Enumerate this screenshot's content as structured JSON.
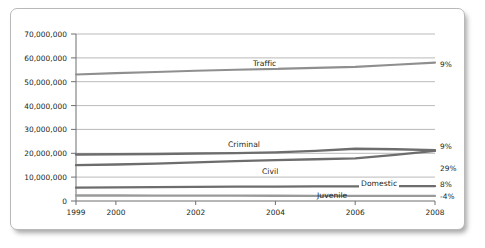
{
  "chart_data": {
    "type": "line",
    "title": "",
    "subtitle": "",
    "xlabel": "",
    "ylabel": "",
    "x": [
      1999,
      2000,
      2001,
      2002,
      2003,
      2004,
      2005,
      2006,
      2007,
      2008
    ],
    "xlim": [
      1999,
      2008
    ],
    "ylim": [
      0,
      70000000
    ],
    "grid": true,
    "grid_axis": "y",
    "legend": "inline-labels",
    "x_tick_labels": [
      "1999",
      "2000",
      "2002",
      "2004",
      "2006",
      "2008"
    ],
    "x_tick_values": [
      1999,
      2000,
      2002,
      2004,
      2006,
      2008
    ],
    "y_tick_labels": [
      "70,000,000",
      "60,000,000",
      "50,000,000",
      "40,000,000",
      "30,000,000",
      "20,000,000",
      "10,000,000",
      "0"
    ],
    "y_tick_values": [
      70000000,
      60000000,
      50000000,
      40000000,
      30000000,
      20000000,
      10000000,
      0
    ],
    "series": [
      {
        "name": "Traffic",
        "label": "Traffic",
        "change_label": "9%",
        "color": "#8f8f8f",
        "values": [
          53000000,
          53600000,
          54100000,
          54600000,
          55000000,
          55400000,
          55800000,
          56200000,
          57100000,
          58000000
        ]
      },
      {
        "name": "Criminal",
        "label": "Criminal",
        "change_label": "9%",
        "color": "#6d6d6d",
        "values": [
          19500000,
          19600000,
          19700000,
          19900000,
          20100000,
          20400000,
          21000000,
          21900000,
          21700000,
          21300000
        ]
      },
      {
        "name": "Civil",
        "label": "Civil",
        "change_label": "29%",
        "color": "#6d6d6d",
        "values": [
          15000000,
          15300000,
          15700000,
          16200000,
          16700000,
          17100000,
          17500000,
          17900000,
          19300000,
          21000000
        ]
      },
      {
        "name": "Domestic",
        "label": "Domestic",
        "change_label": "8%",
        "color": "#6d6d6d",
        "values": [
          5600000,
          5700000,
          5800000,
          5900000,
          6000000,
          6050000,
          6100000,
          6150000,
          6200000,
          6200000
        ]
      },
      {
        "name": "Juvenile",
        "label": "Juvenile",
        "change_label": "-4%",
        "color": "#9a9a9a",
        "values": [
          2300000,
          2300000,
          2280000,
          2250000,
          2220000,
          2200000,
          2180000,
          2160000,
          2140000,
          2120000
        ]
      }
    ]
  },
  "axes": {
    "y_ticks": [
      {
        "label": "70,000,000",
        "value": 70000000
      },
      {
        "label": "60,000,000",
        "value": 60000000
      },
      {
        "label": "50,000,000",
        "value": 50000000
      },
      {
        "label": "40,000,000",
        "value": 40000000
      },
      {
        "label": "30,000,000",
        "value": 30000000
      },
      {
        "label": "20,000,000",
        "value": 20000000
      },
      {
        "label": "10,000,000",
        "value": 10000000
      },
      {
        "label": "0",
        "value": 0
      }
    ],
    "x_ticks": [
      {
        "label": "1999",
        "value": 1999
      },
      {
        "label": "2000",
        "value": 2000
      },
      {
        "label": "2002",
        "value": 2002
      },
      {
        "label": "2004",
        "value": 2004
      },
      {
        "label": "2006",
        "value": 2006
      },
      {
        "label": "2008",
        "value": 2008
      }
    ]
  },
  "colors": {
    "plot_background": "#ffffff",
    "card_border": "#b9b9b9",
    "gridline": "#a8a8a8",
    "axis_line": "#6f6f6f",
    "text": "#231f20"
  }
}
